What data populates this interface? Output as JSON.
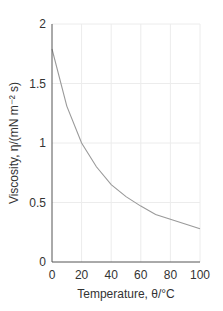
{
  "chart_data": {
    "type": "line",
    "title": "",
    "xlabel": "Temperature, θ/°C",
    "ylabel": "Viscosity, η/(mN m⁻² s)",
    "xlim": [
      0,
      100
    ],
    "ylim": [
      0,
      2
    ],
    "x_ticks": [
      "0",
      "20",
      "40",
      "60",
      "80",
      "100"
    ],
    "y_ticks": [
      "0",
      "0.5",
      "1",
      "1.5",
      "2"
    ],
    "grid": true,
    "legend": null,
    "series": [
      {
        "name": "viscosity",
        "x": [
          0,
          10,
          20,
          30,
          40,
          50,
          60,
          70,
          80,
          90,
          100
        ],
        "values": [
          1.79,
          1.31,
          1.0,
          0.8,
          0.65,
          0.55,
          0.47,
          0.4,
          0.36,
          0.32,
          0.28
        ]
      }
    ],
    "colors": {
      "axis": "#555555",
      "curve": "#9a9a9a",
      "grid": "#ececec"
    }
  }
}
